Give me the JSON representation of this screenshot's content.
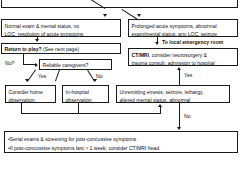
{
  "diagram": {
    "top_partial_box": {
      "visible_text": ""
    },
    "nodes": {
      "normal_exam": {
        "line1": "Normal exam & mental status, no",
        "line2": "LOC, resolution of acute symptoms"
      },
      "prolonged": {
        "line1": "Prolonged acute symptoms, abnormal",
        "line2": "exam/mental status, any LOC, seizure"
      },
      "return_to_play": {
        "bold": "Return to play?",
        "normal": " (See next page)"
      },
      "ct_mri": {
        "bold": "CT/MRI",
        "line1_rest": ", consider neurosurgery &",
        "line2": "trauma consult, admission to hospital"
      },
      "reliable_caregivers": {
        "text": "Reliable caregivers?"
      },
      "consider_home": {
        "line1": "Consider home",
        "line2": "observation"
      },
      "in_hospital": {
        "line1": "In-hospital",
        "line2": "observation"
      },
      "unremitting": {
        "line1": "Unremitting emesis, seizure, lethargy,",
        "line2": "altered mental status, abnormal"
      },
      "bottom": {
        "line1": "•Serial exams & screening for post-concussive symptoms",
        "line2": "•If post-concussive symptoms last > 1 week, consider CT/MRI head."
      }
    },
    "edge_labels": {
      "to_local_er": "To local emergency room",
      "no_question": "No?",
      "yes_caregivers": "Yes",
      "no_caregivers": "No",
      "yes_unremitting": "Yes",
      "no_unremitting": "No"
    },
    "colors": {
      "line": "#1a1a1a",
      "background": "#ffffff",
      "text": "#111111"
    }
  }
}
